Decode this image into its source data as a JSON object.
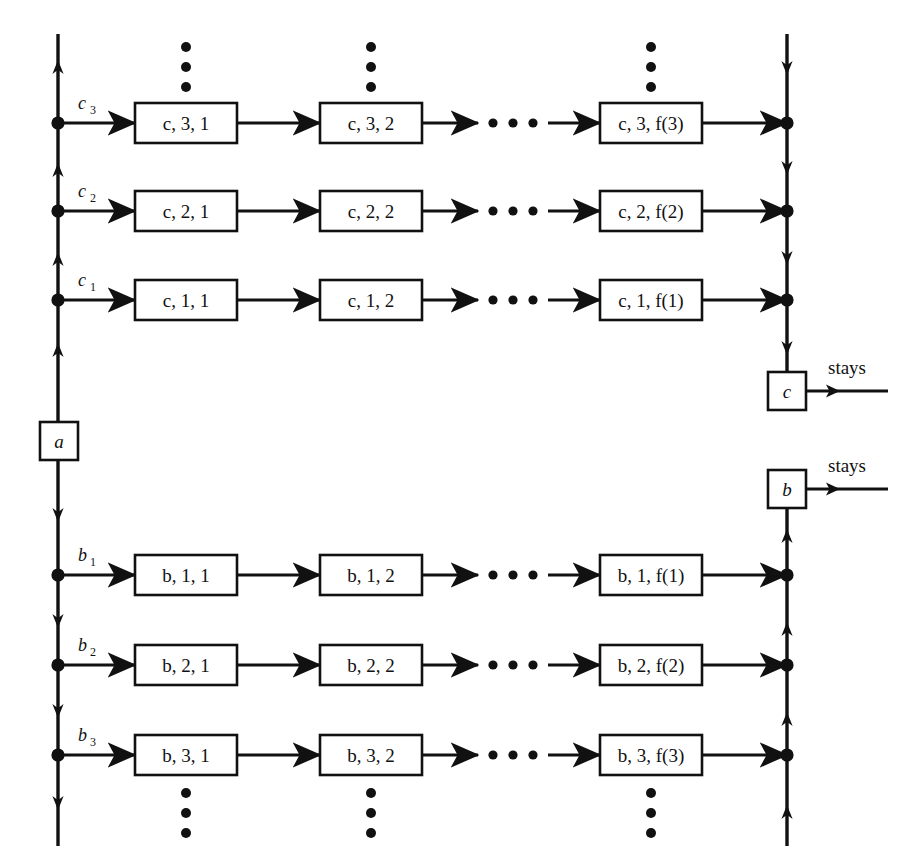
{
  "diagram": {
    "title": "",
    "colors": {
      "stroke": "#111111",
      "fill": "#ffffff",
      "background": "#ffffff"
    },
    "nodes": {
      "a": "a",
      "c": "c",
      "b": "b"
    },
    "stays_label_c": "stays",
    "stays_label_b": "stays",
    "rows": [
      {
        "id": "c3",
        "edge_label_letter": "c",
        "edge_label_sub": "3",
        "boxes": [
          "c, 3, 1",
          "c, 3, 2",
          "c, 3, f(3)"
        ],
        "ellipsis": "horizontal"
      },
      {
        "id": "c2",
        "edge_label_letter": "c",
        "edge_label_sub": "2",
        "boxes": [
          "c, 2, 1",
          "c, 2, 2",
          "c, 2, f(2)"
        ],
        "ellipsis": "horizontal"
      },
      {
        "id": "c1",
        "edge_label_letter": "c",
        "edge_label_sub": "1",
        "boxes": [
          "c, 1, 1",
          "c, 1, 2",
          "c, 1, f(1)"
        ],
        "ellipsis": "horizontal"
      },
      {
        "id": "b1",
        "edge_label_letter": "b",
        "edge_label_sub": "1",
        "boxes": [
          "b, 1, 1",
          "b, 1, 2",
          "b, 1, f(1)"
        ],
        "ellipsis": "horizontal"
      },
      {
        "id": "b2",
        "edge_label_letter": "b",
        "edge_label_sub": "2",
        "boxes": [
          "b, 2, 1",
          "b, 2, 2",
          "b, 2, f(2)"
        ],
        "ellipsis": "horizontal"
      },
      {
        "id": "b3",
        "edge_label_letter": "b",
        "edge_label_sub": "3",
        "boxes": [
          "b, 3, 1",
          "b, 3, 2",
          "b, 3, f(3)"
        ],
        "ellipsis": "horizontal"
      }
    ],
    "vertical_ellipsis": {
      "top": "three vertical dots above the c,3 row of boxes",
      "bottom": "three vertical dots below the b,3 row of boxes"
    },
    "flow": {
      "left_rail_above_a": "up",
      "left_rail_below_a": "down",
      "right_rail_above_c": "down",
      "right_rail_below_b": "up"
    }
  }
}
